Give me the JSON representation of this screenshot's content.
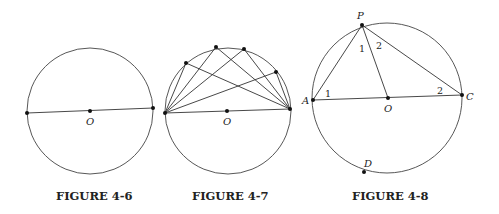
{
  "figures": [
    {
      "id": "4-6",
      "caption": "FIGURE 4-6",
      "center_label": "O",
      "circle": {
        "cx": 90,
        "cy": 111,
        "r": 63
      },
      "diameter": {
        "x1": 27,
        "y1": 113,
        "x2": 153,
        "y2": 108
      }
    },
    {
      "id": "4-7",
      "caption": "FIGURE 4-7",
      "center_label": "O",
      "circle": {
        "cx": 228,
        "cy": 111,
        "r": 63
      },
      "diameter": {
        "x1": 165,
        "y1": 113,
        "x2": 290,
        "y2": 109
      },
      "arc_points": [
        [
          186,
          63
        ],
        [
          216,
          47
        ],
        [
          244,
          49
        ],
        [
          276,
          72
        ]
      ]
    },
    {
      "id": "4-8",
      "caption": "FIGURE 4-8",
      "circle": {
        "cx": 387,
        "cy": 98,
        "r": 75
      },
      "points": {
        "P": {
          "label": "P",
          "x": 362,
          "y": 25
        },
        "A": {
          "label": "A",
          "x": 313,
          "y": 100
        },
        "O": {
          "label": "O",
          "x": 388,
          "y": 98
        },
        "C": {
          "label": "C",
          "x": 462,
          "y": 95
        },
        "D": {
          "label": "D",
          "x": 364,
          "y": 172
        }
      },
      "angle_labels": [
        {
          "text": "1",
          "at": "A"
        },
        {
          "text": "1",
          "at": "P-left"
        },
        {
          "text": "2",
          "at": "P-right"
        },
        {
          "text": "2",
          "at": "C"
        }
      ]
    }
  ]
}
